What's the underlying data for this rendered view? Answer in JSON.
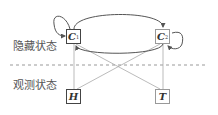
{
  "layers": {
    "hidden_label": "隐藏状态",
    "observed_label": "观测状态"
  },
  "nodes": {
    "c1": {
      "label": "C",
      "sub": "1",
      "border": "#444444"
    },
    "c2": {
      "label": "C",
      "sub": "2",
      "border": "#999999"
    },
    "h": {
      "label": "H",
      "border": "#444444"
    },
    "t": {
      "label": "T",
      "border": "#999999"
    }
  },
  "colors": {
    "edge_dark": "#555555",
    "edge_light": "#aaaaaa",
    "divider": "#999999"
  }
}
